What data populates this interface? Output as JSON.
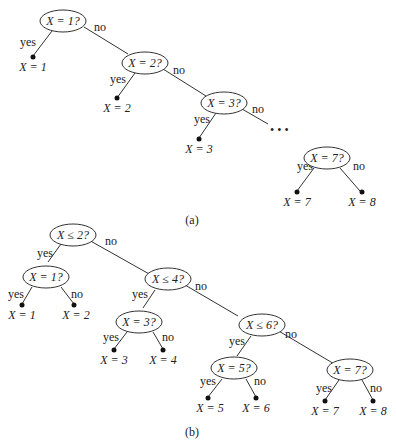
{
  "figure": {
    "subfigures": [
      {
        "caption": "(a)",
        "edge_labels": {
          "yes": "yes",
          "no": "no"
        },
        "ellipsis": "• • •",
        "nodes": [
          {
            "id": "a1",
            "text": "X = 1?"
          },
          {
            "id": "a2",
            "text": "X = 2?"
          },
          {
            "id": "a3",
            "text": "X = 3?"
          },
          {
            "id": "a7",
            "text": "X = 7?"
          }
        ],
        "leaves": [
          {
            "id": "al1",
            "text": "X = 1"
          },
          {
            "id": "al2",
            "text": "X = 2"
          },
          {
            "id": "al3",
            "text": "X = 3"
          },
          {
            "id": "al7",
            "text": "X = 7"
          },
          {
            "id": "al8",
            "text": "X = 8"
          }
        ]
      },
      {
        "caption": "(b)",
        "edge_labels": {
          "yes": "yes",
          "no": "no"
        },
        "nodes": [
          {
            "id": "b2",
            "text": "X ≤ 2?"
          },
          {
            "id": "b1",
            "text": "X = 1?"
          },
          {
            "id": "b4",
            "text": "X ≤ 4?"
          },
          {
            "id": "b3",
            "text": "X = 3?"
          },
          {
            "id": "b6",
            "text": "X ≤ 6?"
          },
          {
            "id": "b5",
            "text": "X = 5?"
          },
          {
            "id": "b7",
            "text": "X = 7?"
          }
        ],
        "leaves": [
          {
            "id": "bl1",
            "text": "X = 1"
          },
          {
            "id": "bl2",
            "text": "X = 2"
          },
          {
            "id": "bl3",
            "text": "X = 3"
          },
          {
            "id": "bl4",
            "text": "X = 4"
          },
          {
            "id": "bl5",
            "text": "X = 5"
          },
          {
            "id": "bl6",
            "text": "X = 6"
          },
          {
            "id": "bl7",
            "text": "X = 7"
          },
          {
            "id": "bl8",
            "text": "X = 8"
          }
        ]
      }
    ]
  }
}
